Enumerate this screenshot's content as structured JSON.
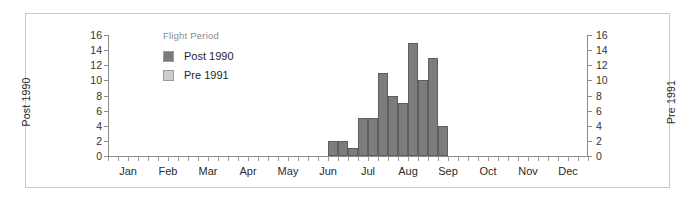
{
  "chart_data": {
    "type": "bar",
    "title": "",
    "xlabel": "",
    "ylabel": "Post 1990",
    "y2label": "Pre 1991",
    "ylim": [
      0,
      16
    ],
    "y2lim": [
      0,
      16
    ],
    "yticks": [
      0,
      2,
      4,
      6,
      8,
      10,
      12,
      14,
      16
    ],
    "y2ticks": [
      0,
      2,
      4,
      6,
      8,
      10,
      12,
      14,
      16
    ],
    "grid": false,
    "legend_position": "upper-left-inside",
    "legend_title": "Flight Period",
    "series": [
      {
        "name": "Post 1990",
        "color": "#7c7c7c",
        "edge_color": "#5e5e5e",
        "x_unit": "week",
        "categories": [
          "Jun wk3",
          "Jul wk1",
          "Jul wk2",
          "Jul wk3",
          "Jul wk4",
          "Aug wk1",
          "Aug wk2",
          "Aug wk3",
          "Aug wk4",
          "Sep wk1",
          "Sep wk2",
          "Sep wk3"
        ],
        "values": [
          2,
          2,
          1,
          5,
          5,
          11,
          8,
          7,
          15,
          10,
          13,
          4
        ]
      },
      {
        "name": "Pre 1991",
        "color": "#cccccc",
        "edge_color": "#9b9b9b",
        "x_unit": "week",
        "categories": [],
        "values": []
      }
    ],
    "x_tick_labels": [
      "Jan",
      "Feb",
      "Mar",
      "Apr",
      "May",
      "Jun",
      "Jul",
      "Aug",
      "Sep",
      "Oct",
      "Nov",
      "Dec"
    ],
    "x_minor_ticks_per_label": 4
  },
  "figure": {
    "legend": {
      "title": "Flight Period",
      "entries": [
        {
          "label": "Post 1990",
          "color": "#7c7c7c"
        },
        {
          "label": "Pre 1991",
          "color": "#cccccc"
        }
      ]
    },
    "axes": {
      "left_title": "Post 1990",
      "right_title": "Pre 1991"
    }
  }
}
